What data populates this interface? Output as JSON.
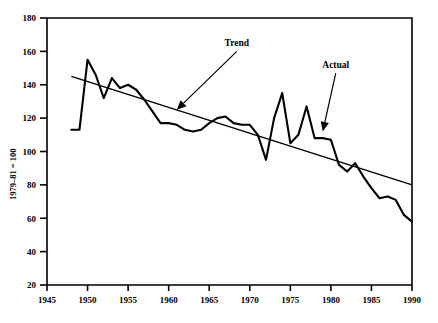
{
  "chart_data": {
    "type": "line",
    "title": "",
    "subtitle": "",
    "xlabel": "",
    "ylabel": "1979–81 = 100",
    "xlim": [
      1945,
      1990
    ],
    "ylim": [
      20,
      180
    ],
    "grid": false,
    "legend_position": "none",
    "x_ticks": [
      1945,
      1950,
      1955,
      1960,
      1965,
      1970,
      1975,
      1980,
      1985,
      1990
    ],
    "y_ticks": [
      20,
      40,
      60,
      80,
      100,
      120,
      140,
      160,
      180
    ],
    "series": [
      {
        "name": "Actual",
        "x": [
          1948,
          1949,
          1950,
          1951,
          1952,
          1953,
          1954,
          1955,
          1956,
          1957,
          1958,
          1959,
          1960,
          1961,
          1962,
          1963,
          1964,
          1965,
          1966,
          1967,
          1968,
          1969,
          1970,
          1971,
          1972,
          1973,
          1974,
          1975,
          1976,
          1977,
          1978,
          1979,
          1980,
          1981,
          1982,
          1983,
          1984,
          1985,
          1986,
          1987,
          1988,
          1989,
          1990
        ],
        "values": [
          113,
          113,
          155,
          146,
          132,
          144,
          138,
          140,
          137,
          131,
          124,
          117,
          117,
          116,
          113,
          112,
          113,
          117,
          120,
          121,
          117,
          116,
          116,
          110,
          95,
          120,
          135,
          105,
          110,
          127,
          108,
          108,
          107,
          92,
          88,
          93,
          85,
          78,
          72,
          73,
          71,
          62,
          58
        ]
      },
      {
        "name": "Trend",
        "x": [
          1948,
          1990
        ],
        "values": [
          145,
          80
        ]
      }
    ],
    "annotations": [
      {
        "text": "Trend",
        "label_x": 1968.4,
        "label_y": 163,
        "arrow_to_x": 1961.0,
        "arrow_to_y": 125
      },
      {
        "text": "Actual",
        "label_x": 1980.6,
        "label_y": 150,
        "arrow_to_x": 1979.0,
        "arrow_to_y": 112
      }
    ],
    "colors": {
      "line": "#000000",
      "axis": "#000000",
      "background": "#ffffff"
    }
  }
}
